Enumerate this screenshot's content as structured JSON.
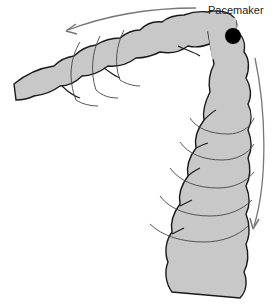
{
  "diagram": {
    "type": "anatomical-illustration",
    "labels": {
      "pacemaker": "Pacemaker"
    },
    "colors": {
      "tube_fill": "#c8c8c8",
      "tube_outline": "#1a1a1a",
      "pacemaker": "#000000",
      "arrow": "#777777",
      "wave_rings": "#444444",
      "background": "#ffffff"
    },
    "arrows": [
      {
        "name": "oral-direction-arrow",
        "direction": "leftward along horizontal segment"
      },
      {
        "name": "aboral-direction-arrow",
        "direction": "downward along vertical segment"
      }
    ]
  }
}
